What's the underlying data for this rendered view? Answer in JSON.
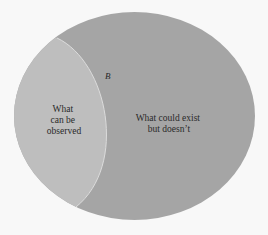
{
  "diagram": {
    "type": "nested-region-diagram",
    "colors": {
      "background": "#f8f8f8",
      "outer_region": "#a5a5a5",
      "inner_region": "#bebebe",
      "boundary_line": "#dcdcdc",
      "text": "#2a2a2a"
    },
    "outer_region": {
      "label_lines": [
        "What could exist",
        "but doesn’t"
      ]
    },
    "inner_region": {
      "label_lines": [
        "What",
        "can be",
        "observed"
      ]
    },
    "boundary_label": "B"
  }
}
